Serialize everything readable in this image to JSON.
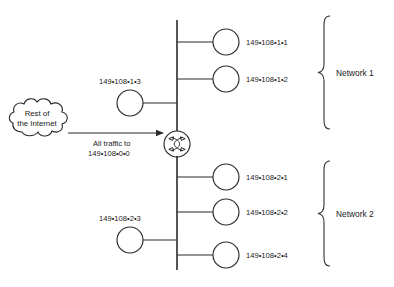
{
  "diagram": {
    "colors": {
      "stroke": "#2b2b2b",
      "text": "#1a1a1a",
      "background": "#ffffff"
    },
    "cloud": {
      "line1": "Rest of",
      "line2": "the Internet",
      "name": "rest-of-the-internet-cloud"
    },
    "uplink": {
      "line1": "All traffic to",
      "line2": "149•108•0•0"
    },
    "router": {
      "name": "router-node"
    },
    "networks": [
      {
        "label": "Network 1",
        "hosts_right": [
          {
            "label": "149•108•1•1"
          },
          {
            "label": "149•108•1•2"
          }
        ],
        "hosts_left": [
          {
            "label": "149•108•1•3"
          }
        ]
      },
      {
        "label": "Network 2",
        "hosts_right": [
          {
            "label": "149•108•2•1"
          },
          {
            "label": "149•108•2•2"
          },
          {
            "label": "149•108•2•4"
          }
        ],
        "hosts_left": [
          {
            "label": "149•108•2•3"
          }
        ]
      }
    ]
  }
}
